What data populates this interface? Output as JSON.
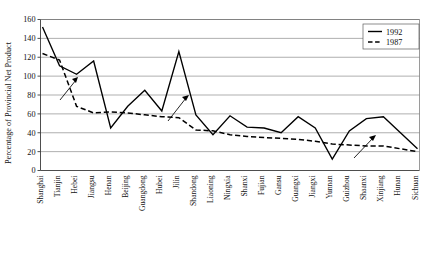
{
  "chart_data": {
    "type": "line",
    "title": "",
    "xlabel": "",
    "ylabel": "Percentage of Provincial Net Product",
    "ylim": [
      0,
      160
    ],
    "yticks": [
      0,
      20,
      40,
      60,
      80,
      100,
      120,
      140,
      160
    ],
    "grid": true,
    "legend_position": "top-right",
    "categories": [
      "Shanghai",
      "Tianjin",
      "Hebei",
      "Jiangsu",
      "Henan",
      "Beijing",
      "Guangdong",
      "Hubei",
      "Jilin",
      "Shandong",
      "Liaoning",
      "Ningxia",
      "Shanxi",
      "Fujian",
      "Gansu",
      "Guangxi",
      "Jiangxi",
      "Yunnan",
      "Guizhou",
      "Shaanxi",
      "Xinjiang",
      "Hunan",
      "Sichuan"
    ],
    "series": [
      {
        "name": "1992",
        "style": "solid",
        "values": [
          152,
          111,
          102,
          116,
          45,
          68,
          85,
          63,
          126,
          59,
          38,
          58,
          46,
          45,
          40,
          57,
          45,
          12,
          42,
          55,
          57,
          40,
          23
        ]
      },
      {
        "name": "1987",
        "style": "dashed",
        "values": [
          124,
          117,
          68,
          61,
          62,
          61,
          59,
          57,
          56,
          43,
          42,
          38,
          36,
          35,
          34,
          33,
          31,
          28,
          27,
          26,
          26,
          23,
          20
        ]
      }
    ],
    "annotations": [
      {
        "name": "arrow-jiangsu",
        "points_to": "Jiangsu 1992 rise"
      },
      {
        "name": "arrow-jilin",
        "points_to": "Jilin 1992 peak"
      },
      {
        "name": "arrow-xinjiang",
        "points_to": "Xinjiang 1992 rise"
      }
    ]
  },
  "legend": {
    "entries": [
      {
        "label": "1992",
        "style": "solid"
      },
      {
        "label": "1987",
        "style": "dashed"
      }
    ]
  },
  "yaxis": {
    "title": "Percentage of Provincial Net Product",
    "ticks": [
      "0",
      "20",
      "40",
      "60",
      "80",
      "100",
      "120",
      "140",
      "160"
    ]
  },
  "colors": {
    "line": "#000000",
    "grid": "#8c8c8c",
    "axis": "#3a3a3a",
    "background": "#ffffff"
  }
}
